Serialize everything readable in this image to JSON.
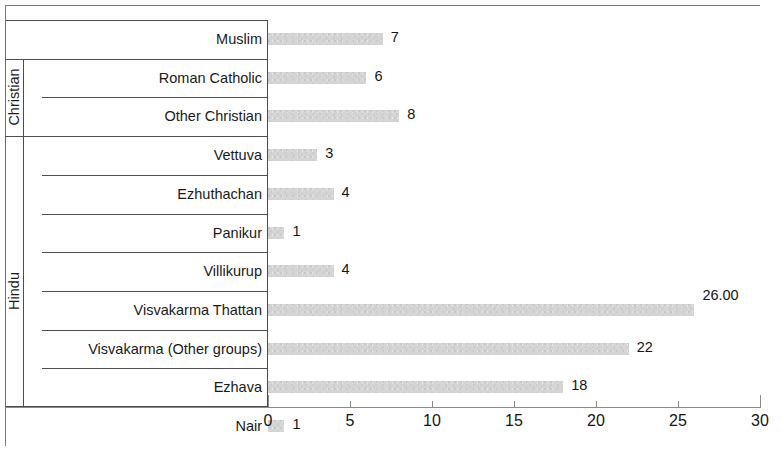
{
  "chart_data": {
    "type": "bar",
    "orientation": "horizontal",
    "title": "",
    "xlabel": "",
    "ylabel": "",
    "xlim": [
      0,
      30
    ],
    "xticks": [
      0,
      5,
      10,
      15,
      20,
      25,
      30
    ],
    "xtick_labels": [
      "0",
      "5",
      "10",
      "15",
      "20",
      "25",
      "30"
    ],
    "grid": false,
    "legend": false,
    "bar_color": "#d5d5d5",
    "categories": [
      "Muslim",
      "Roman Catholic",
      "Other Christian",
      "Vettuva",
      "Ezhuthachan",
      "Panikur",
      "Villikurup",
      "Visvakarma Thattan",
      "Visvakarma (Other groups)",
      "Ezhava",
      "Nair"
    ],
    "values": [
      7,
      6,
      8,
      3,
      4,
      1,
      4,
      26,
      22,
      18,
      1
    ],
    "data_labels": [
      "7",
      "6",
      "8",
      "3",
      "4",
      "1",
      "4",
      "26.00",
      "22",
      "18",
      "1"
    ],
    "groups": [
      {
        "label": "Christian",
        "members": [
          "Roman Catholic",
          "Other Christian"
        ]
      },
      {
        "label": "Hindu",
        "members": [
          "Vettuva",
          "Ezhuthachan",
          "Panikur",
          "Villikurup",
          "Visvakarma Thattan",
          "Visvakarma (Other groups)",
          "Ezhava",
          "Nair"
        ]
      }
    ]
  },
  "rows": [
    {
      "label": "Muslim",
      "value": 7,
      "data_label": "7",
      "indent": false,
      "raised": false
    },
    {
      "label": "Roman Catholic",
      "value": 6,
      "data_label": "6",
      "indent": false,
      "raised": false
    },
    {
      "label": "Other Christian",
      "value": 8,
      "data_label": "8",
      "indent": true,
      "raised": false
    },
    {
      "label": "Vettuva",
      "value": 3,
      "data_label": "3",
      "indent": false,
      "raised": false
    },
    {
      "label": "Ezhuthachan",
      "value": 4,
      "data_label": "4",
      "indent": true,
      "raised": false
    },
    {
      "label": "Panikur",
      "value": 1,
      "data_label": "1",
      "indent": true,
      "raised": false
    },
    {
      "label": "Villikurup",
      "value": 4,
      "data_label": "4",
      "indent": true,
      "raised": false
    },
    {
      "label": "Visvakarma Thattan",
      "value": 26,
      "data_label": "26.00",
      "indent": true,
      "raised": true
    },
    {
      "label": "Visvakarma (Other groups)",
      "value": 22,
      "data_label": "22",
      "indent": true,
      "raised": false
    },
    {
      "label": "Ezhava",
      "value": 18,
      "data_label": "18",
      "indent": true,
      "raised": false
    },
    {
      "label": "Nair",
      "value": 1,
      "data_label": "1",
      "indent": true,
      "raised": false
    }
  ],
  "group_labels": [
    {
      "text": "Christian",
      "start_row": 1,
      "end_row": 2
    },
    {
      "text": "Hindu",
      "start_row": 3,
      "end_row": 10
    }
  ],
  "axis": {
    "min": 0,
    "max": 30,
    "step": 5,
    "ticks": [
      "0",
      "5",
      "10",
      "15",
      "20",
      "25",
      "30"
    ]
  }
}
